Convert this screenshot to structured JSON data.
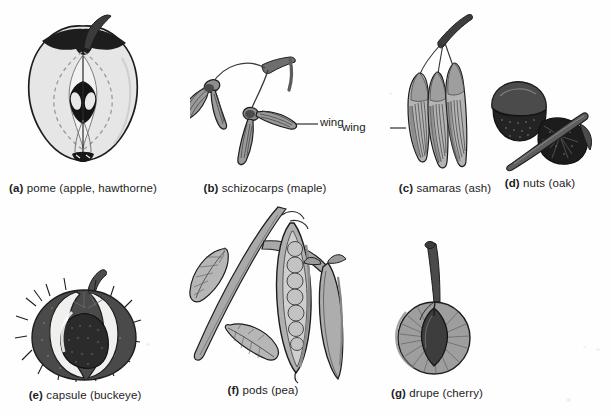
{
  "figure": {
    "background_color": "#fefefe",
    "ink_color": "#1d1d1d",
    "fill_light": "#e3e3e3",
    "fill_mid": "#a8a8a8",
    "fill_dark": "#555555",
    "fill_black": "#2b2b2b"
  },
  "panels": [
    {
      "id": "a",
      "label": "(a)",
      "name": "pome",
      "parenthetical": "(apple, hawthorne)",
      "caption_text": "pome (apple, hawthorne)",
      "callouts": []
    },
    {
      "id": "b",
      "label": "(b)",
      "name": "schizocarps",
      "parenthetical": "(maple)",
      "caption_text": "schizocarps (maple)",
      "callouts": [
        {
          "text": "wing",
          "side": "right"
        }
      ]
    },
    {
      "id": "c",
      "label": "(c)",
      "name": "samaras",
      "parenthetical": "(ash)",
      "caption_text": "samaras (ash)",
      "callouts": [
        {
          "text": "wing",
          "side": "left"
        }
      ]
    },
    {
      "id": "d",
      "label": "(d)",
      "name": "nuts",
      "parenthetical": "(oak)",
      "caption_text": "nuts (oak)",
      "callouts": []
    },
    {
      "id": "e",
      "label": "(e)",
      "name": "capsule",
      "parenthetical": "(buckeye)",
      "caption_text": "capsule (buckeye)",
      "callouts": []
    },
    {
      "id": "f",
      "label": "(f)",
      "name": "pods",
      "parenthetical": "(pea)",
      "caption_text": "pods (pea)",
      "callouts": []
    },
    {
      "id": "g",
      "label": "(g)",
      "name": "drupe",
      "parenthetical": "(cherry)",
      "caption_text": "drupe (cherry)",
      "callouts": []
    }
  ]
}
